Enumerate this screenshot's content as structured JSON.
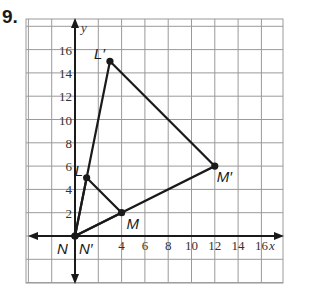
{
  "problem": {
    "number": "9."
  },
  "graph": {
    "x_axis_label": "x",
    "y_axis_label": "y",
    "x_ticks": [
      "4",
      "6",
      "8",
      "10",
      "12",
      "14",
      "16"
    ],
    "y_ticks": [
      "2",
      "4",
      "6",
      "8",
      "10",
      "12",
      "14",
      "16"
    ],
    "grid_step": 2,
    "colors": {
      "grid": "#9a9a9a",
      "lines": "#1a1a1a"
    }
  },
  "figures": {
    "original": {
      "name": "LMN",
      "points": [
        {
          "label": "L",
          "x": 1,
          "y": 5
        },
        {
          "label": "M",
          "x": 4,
          "y": 2
        },
        {
          "label": "N",
          "x": 0,
          "y": 0
        }
      ]
    },
    "image": {
      "name": "L'M'N'",
      "points": [
        {
          "label": "L′",
          "x": 3,
          "y": 15
        },
        {
          "label": "M′",
          "x": 12,
          "y": 6
        },
        {
          "label": "N′",
          "x": 0,
          "y": 0
        }
      ]
    }
  },
  "chart_data": {
    "type": "scatter",
    "title": "",
    "xlabel": "x",
    "ylabel": "y",
    "xlim": [
      -4,
      18
    ],
    "ylim": [
      -4,
      18
    ],
    "grid": true,
    "series": [
      {
        "name": "Triangle LMN",
        "x": [
          1,
          4,
          0
        ],
        "y": [
          5,
          2,
          0
        ],
        "labels": [
          "L",
          "M",
          "N"
        ]
      },
      {
        "name": "Triangle L'M'N'",
        "x": [
          3,
          12,
          0
        ],
        "y": [
          15,
          6,
          0
        ],
        "labels": [
          "L′",
          "M′",
          "N′"
        ]
      }
    ]
  }
}
